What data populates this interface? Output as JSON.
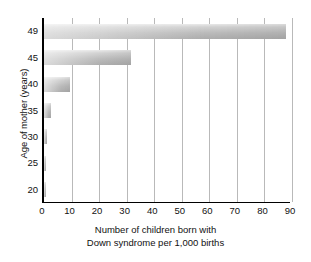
{
  "chart_data": {
    "type": "bar",
    "orientation": "horizontal",
    "title": "",
    "subtitle": "",
    "xlabel_line1": "Number of children born with",
    "xlabel_line2": "Down syndrome per 1,000 births",
    "ylabel": "Age of mother (years)",
    "categories": [
      "20",
      "25",
      "30",
      "35",
      "40",
      "45",
      "49"
    ],
    "values": [
      0.7,
      0.8,
      1.0,
      2.5,
      9.5,
      31.5,
      88.0
    ],
    "series": [
      {
        "name": "Down syndrome births per 1,000",
        "values": [
          0.7,
          0.8,
          1.0,
          2.5,
          9.5,
          31.5,
          88.0
        ]
      }
    ],
    "xlim": [
      0,
      90
    ],
    "xticks": [
      0,
      10,
      20,
      30,
      40,
      50,
      60,
      70,
      80,
      90
    ],
    "ytick_labels": [
      "49",
      "45",
      "40",
      "35",
      "30",
      "25",
      "20"
    ],
    "grid": "vertical",
    "legend": "none",
    "bar_color_light": "#eaeaea",
    "bar_color_dark": "#adadad",
    "axis_color": "#000000",
    "gridline_color": "#b9b9b9",
    "background": "#ffffff"
  },
  "axes": {
    "x_title_line1": "Number of children born with",
    "x_title_line2": "Down syndrome per 1,000 births",
    "y_title": "Age of mother (years)"
  }
}
